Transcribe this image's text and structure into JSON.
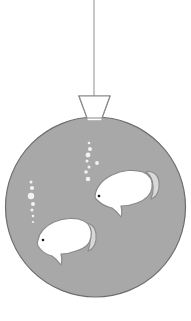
{
  "illustration": {
    "title": "Hanging spherical fishbowl ornament with two fish",
    "subject": "fishbowl",
    "style": "flat grayscale clipart line art",
    "canvas": {
      "width": 191,
      "height": 321,
      "background": "#ffffff"
    }
  },
  "palette": {
    "background": "#ffffff",
    "water_fill": "#a8a8a8",
    "water_stroke": "#6e6e6e",
    "fish_fill": "#ffffff",
    "fish_stroke": "#8a8a8a",
    "fish_tail_fill": "#d8d8d8",
    "fish_eye": "#1a1a1a",
    "bubble_fill": "#f2f2f2",
    "string_stroke": "#9a9a9a",
    "neck_fill": "#ffffff",
    "neck_stroke": "#8a8a8a"
  },
  "parts": {
    "hanging_string": {
      "label": "hanging string",
      "x": 94,
      "y_top": 0,
      "y_bottom": 96,
      "stroke_width": 1.1
    },
    "neck": {
      "label": "bowl neck",
      "shape": "inverted trapezoid",
      "top_left_x": 79,
      "top_right_x": 110,
      "top_y": 96,
      "bottom_left_x": 87,
      "bottom_right_x": 102,
      "bottom_y": 118
    },
    "bowl": {
      "label": "spherical water bowl",
      "center_x": 95.5,
      "center_y": 207,
      "radius_x": 90,
      "radius_y": 90,
      "stroke_width": 1.2
    }
  },
  "fish": [
    {
      "name": "upper-fish",
      "label": "upper fish",
      "facing": "left",
      "center_x": 128,
      "center_y": 190,
      "length": 62,
      "height": 40,
      "eye_x": 99,
      "eye_y": 196,
      "eye_size": 2.6
    },
    {
      "name": "lower-fish",
      "label": "lower fish",
      "facing": "left",
      "center_x": 64,
      "center_y": 240,
      "length": 58,
      "height": 38,
      "eye_x": 43,
      "eye_y": 240,
      "eye_size": 2.6
    }
  ],
  "bubble_streams": [
    {
      "name": "left-bubble-stream",
      "label": "left bubble stream",
      "bubbles": [
        {
          "cx": 31,
          "cy": 182,
          "r": 1.5
        },
        {
          "cx": 32,
          "cy": 188,
          "r": 2.1
        },
        {
          "cx": 31,
          "cy": 196,
          "r": 3.2
        },
        {
          "cx": 33,
          "cy": 204,
          "r": 2.0
        },
        {
          "cx": 32,
          "cy": 210,
          "r": 1.6
        },
        {
          "cx": 33,
          "cy": 216,
          "r": 1.3
        },
        {
          "cx": 33,
          "cy": 222,
          "r": 1.1
        }
      ]
    },
    {
      "name": "center-bubble-stream",
      "label": "center bubble stream",
      "bubbles": [
        {
          "cx": 89,
          "cy": 143,
          "r": 1.3
        },
        {
          "cx": 90,
          "cy": 149,
          "r": 2.0
        },
        {
          "cx": 88,
          "cy": 155,
          "r": 2.4
        },
        {
          "cx": 87,
          "cy": 161,
          "r": 1.5
        },
        {
          "cx": 89,
          "cy": 167,
          "r": 1.5
        },
        {
          "cx": 86,
          "cy": 172,
          "r": 1.8
        },
        {
          "cx": 88,
          "cy": 179,
          "r": 2.3
        },
        {
          "cx": 97,
          "cy": 163,
          "r": 1.9
        }
      ]
    }
  ]
}
